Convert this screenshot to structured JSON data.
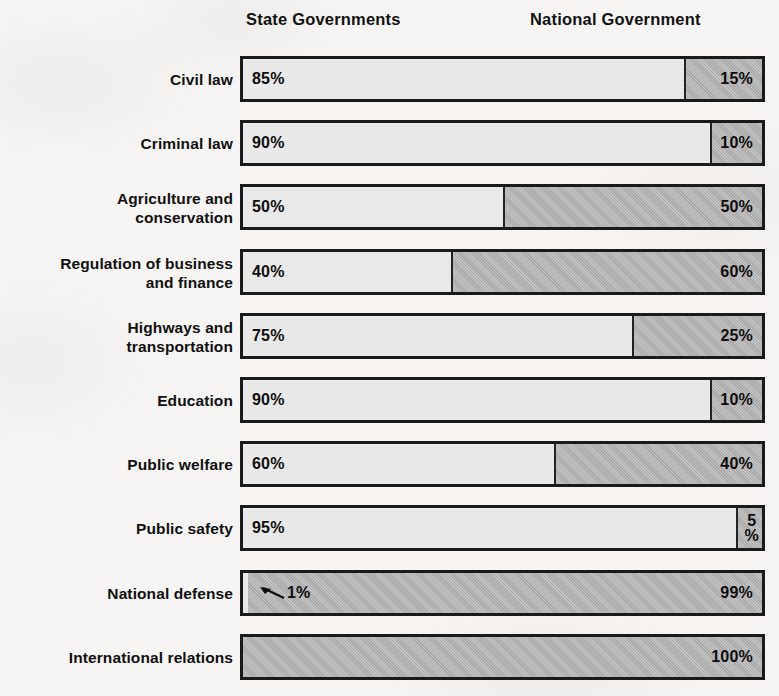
{
  "legend": {
    "state": "State Governments",
    "national": "National Government"
  },
  "chart_data": {
    "type": "bar",
    "subtype": "stacked-horizontal-100-percent",
    "title": "",
    "xlabel": "",
    "ylabel": "",
    "xlim": [
      0,
      100
    ],
    "grid": false,
    "legend_position": "top",
    "categories": [
      "Civil law",
      "Criminal law",
      "Agriculture and\nconservation",
      "Regulation of business\nand finance",
      "Highways and\ntransportation",
      "Education",
      "Public welfare",
      "Public safety",
      "National defense",
      "International relations"
    ],
    "series": [
      {
        "name": "State Governments",
        "color": "#ebebeb",
        "values": [
          85,
          90,
          50,
          40,
          75,
          90,
          60,
          95,
          1,
          0
        ],
        "labels": [
          "85%",
          "90%",
          "50%",
          "40%",
          "75%",
          "90%",
          "60%",
          "95%",
          "1%",
          ""
        ]
      },
      {
        "name": "National Government",
        "color": "#a9a9a9",
        "values": [
          15,
          10,
          50,
          60,
          25,
          10,
          40,
          5,
          99,
          100
        ],
        "labels": [
          "15%",
          "10%",
          "50%",
          "60%",
          "25%",
          "10%",
          "40%",
          "5\n%",
          "99%",
          "100%"
        ]
      }
    ],
    "rows": [
      {
        "label": "Civil law",
        "state": 85,
        "national": 15,
        "state_label": "85%",
        "national_label": "15%",
        "national_label_stacked": false,
        "state_label_inside": true,
        "callout": false
      },
      {
        "label": "Criminal law",
        "state": 90,
        "national": 10,
        "state_label": "90%",
        "national_label": "10%",
        "national_label_stacked": false,
        "state_label_inside": true,
        "callout": false
      },
      {
        "label": "Agriculture and\nconservation",
        "state": 50,
        "national": 50,
        "state_label": "50%",
        "national_label": "50%",
        "national_label_stacked": false,
        "state_label_inside": true,
        "callout": false
      },
      {
        "label": "Regulation of business\nand finance",
        "state": 40,
        "national": 60,
        "state_label": "40%",
        "national_label": "60%",
        "national_label_stacked": false,
        "state_label_inside": true,
        "callout": false
      },
      {
        "label": "Highways and\ntransportation",
        "state": 75,
        "national": 25,
        "state_label": "75%",
        "national_label": "25%",
        "national_label_stacked": false,
        "state_label_inside": true,
        "callout": false
      },
      {
        "label": "Education",
        "state": 90,
        "national": 10,
        "state_label": "90%",
        "national_label": "10%",
        "national_label_stacked": false,
        "state_label_inside": true,
        "callout": false
      },
      {
        "label": "Public welfare",
        "state": 60,
        "national": 40,
        "state_label": "60%",
        "national_label": "40%",
        "national_label_stacked": false,
        "state_label_inside": true,
        "callout": false
      },
      {
        "label": "Public safety",
        "state": 95,
        "national": 5,
        "state_label": "95%",
        "national_label_line1": "5",
        "national_label_line2": "%",
        "national_label_stacked": true,
        "state_label_inside": true,
        "callout": false
      },
      {
        "label": "National defense",
        "state": 1,
        "national": 99,
        "state_label": "1%",
        "national_label": "99%",
        "national_label_stacked": false,
        "state_label_inside": false,
        "callout": true
      },
      {
        "label": "International relations",
        "state": 0,
        "national": 100,
        "state_label": "",
        "national_label": "100%",
        "national_label_stacked": false,
        "state_label_inside": false,
        "callout": false
      }
    ]
  },
  "colors": {
    "state_fill": "#ebebeb",
    "national_fill": "#a9a9a9",
    "outline": "#1a1a1a",
    "page_background": "#f6f5f3",
    "text": "#101010"
  }
}
